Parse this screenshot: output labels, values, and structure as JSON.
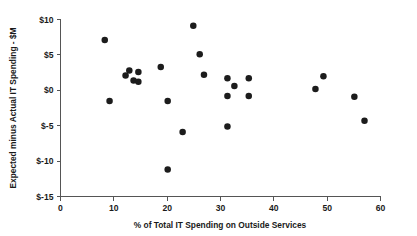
{
  "chart_data": {
    "type": "scatter",
    "title": "",
    "xlabel": "% of Total IT Spending on Outside Services",
    "ylabel": "Expected minus Actual IT Spending - $M",
    "xlim": [
      0,
      60
    ],
    "ylim": [
      -15,
      10
    ],
    "xticks": [
      0,
      10,
      20,
      30,
      40,
      50,
      60
    ],
    "xticklabels": [
      "0",
      "10",
      "20",
      "30",
      "40",
      "50",
      "60"
    ],
    "yticks": [
      10,
      5,
      0,
      -5,
      -10,
      -15
    ],
    "yticklabels": [
      "$10",
      "$5",
      "$0",
      "$-5",
      "$-10",
      "$-15"
    ],
    "grid": false,
    "legend": false,
    "marker": "filled-circle",
    "marker_color": "#1c1c1c",
    "marker_size": 5.2,
    "axis_color": "#555555",
    "background_color": "#ffffff",
    "points": [
      {
        "x": 8.3,
        "y": 7.1
      },
      {
        "x": 9.2,
        "y": -1.5
      },
      {
        "x": 12.2,
        "y": 2.1
      },
      {
        "x": 12.9,
        "y": 2.8
      },
      {
        "x": 13.7,
        "y": 1.4
      },
      {
        "x": 14.6,
        "y": 2.6
      },
      {
        "x": 14.6,
        "y": 1.2
      },
      {
        "x": 18.8,
        "y": 3.3
      },
      {
        "x": 20.1,
        "y": -1.5
      },
      {
        "x": 20.1,
        "y": -11.2
      },
      {
        "x": 22.9,
        "y": -5.9
      },
      {
        "x": 24.9,
        "y": 9.1
      },
      {
        "x": 26.1,
        "y": 5.1
      },
      {
        "x": 26.9,
        "y": 2.2
      },
      {
        "x": 31.3,
        "y": 1.7
      },
      {
        "x": 31.3,
        "y": -0.8
      },
      {
        "x": 31.3,
        "y": -5.1
      },
      {
        "x": 32.6,
        "y": 0.6
      },
      {
        "x": 35.3,
        "y": 1.7
      },
      {
        "x": 35.3,
        "y": -0.8
      },
      {
        "x": 47.8,
        "y": 0.2
      },
      {
        "x": 49.3,
        "y": 2.0
      },
      {
        "x": 55.1,
        "y": -0.9
      },
      {
        "x": 57.0,
        "y": -4.3
      }
    ]
  }
}
